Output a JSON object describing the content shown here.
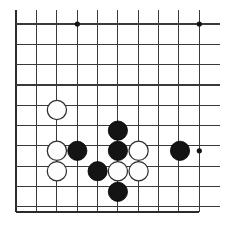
{
  "figure": {
    "kind": "go-board-diagram",
    "background_color": "#ffffff",
    "line_color": "#3a3a3a",
    "edge_line_color": "#2b2b2b",
    "black_stone_color": "#141414",
    "white_stone_color": "#fdfdfd",
    "white_stone_outline_color": "#2f2f2f",
    "star_point_color": "#111111"
  },
  "board": {
    "grid_spacing": 20.33,
    "stone_radius": 9.6,
    "star_radius": 2.6,
    "origin_x": 16.3,
    "origin_y": 3.6,
    "columns": 10,
    "rows": 11,
    "left_edge_x": 16.3,
    "right_edge_x": 199.3,
    "bottom_edge_y": 212.0,
    "vertical_line_top_y": 9.5,
    "vertical_line_bottom_y": 212.0,
    "horizontal_line_left_x": 16.3,
    "horizontal_line_right_x": 220.0,
    "vertical_lines_x": [
      16.3,
      36.6,
      56.9,
      77.3,
      97.6,
      117.9,
      138.2,
      158.6,
      178.9,
      199.3
    ],
    "horizontal_lines_y": [
      24.0,
      44.3,
      64.6,
      85.0,
      105.3,
      125.6,
      145.9,
      166.3,
      186.6,
      206.9,
      212.0
    ],
    "edge_lines": {
      "left_vertical_x": 16.3,
      "bottom_horizontal_y": 212.0
    }
  },
  "star_points": [
    {
      "name": "star-point-top-left",
      "x": 77.3,
      "y": 24.0
    },
    {
      "name": "star-point-top-right",
      "x": 199.3,
      "y": 24.0
    },
    {
      "name": "star-point-center-right",
      "x": 199.3,
      "y": 150.8
    }
  ],
  "stones": [
    {
      "id": 1,
      "color": "white",
      "x": 56.9,
      "y": 110.0
    },
    {
      "id": 2,
      "color": "black",
      "x": 117.9,
      "y": 130.6
    },
    {
      "id": 3,
      "color": "white",
      "x": 56.9,
      "y": 150.8
    },
    {
      "id": 4,
      "color": "black",
      "x": 77.3,
      "y": 150.8
    },
    {
      "id": 5,
      "color": "black",
      "x": 117.9,
      "y": 150.8
    },
    {
      "id": 6,
      "color": "white",
      "x": 138.6,
      "y": 150.8
    },
    {
      "id": 7,
      "color": "black",
      "x": 180.0,
      "y": 150.8
    },
    {
      "id": 8,
      "color": "white",
      "x": 56.9,
      "y": 171.2
    },
    {
      "id": 9,
      "color": "black",
      "x": 97.6,
      "y": 171.2
    },
    {
      "id": 10,
      "color": "white",
      "x": 117.9,
      "y": 171.2
    },
    {
      "id": 11,
      "color": "white",
      "x": 138.6,
      "y": 171.2
    },
    {
      "id": 12,
      "color": "black",
      "x": 117.9,
      "y": 191.8
    }
  ],
  "counts": {
    "black_stones": 5,
    "white_stones": 7,
    "total_stones": 12,
    "star_points": 3
  }
}
